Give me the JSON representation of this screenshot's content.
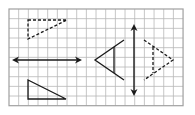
{
  "diagram": {
    "title": "",
    "grid": {
      "left": 9,
      "top": 9,
      "cols": 18,
      "rows": 10,
      "cell": 9.67,
      "line_color": "#b8b8b8",
      "border_color": "#a0a0a0"
    },
    "shapes": [
      {
        "id": "top-left-dashed-triangle",
        "type": "polygon",
        "style": "dashed",
        "points": [
          [
            28,
            20
          ],
          [
            67,
            20
          ],
          [
            28,
            39
          ]
        ]
      },
      {
        "id": "horizontal-double-arrow",
        "type": "double-arrow",
        "from": [
          12,
          60
        ],
        "to": [
          82,
          60
        ]
      },
      {
        "id": "bottom-left-solid-triangle",
        "type": "polygon",
        "style": "solid",
        "points": [
          [
            28,
            80
          ],
          [
            28,
            99
          ],
          [
            66,
            99
          ]
        ]
      },
      {
        "id": "left-solid-kite-triangle",
        "type": "open-polyline",
        "style": "solid",
        "points": [
          [
            124,
            40
          ],
          [
            95,
            60
          ],
          [
            124,
            80
          ]
        ]
      },
      {
        "id": "left-solid-inner-line",
        "type": "line",
        "style": "solid",
        "from": [
          114,
          47
        ],
        "to": [
          114,
          73
        ]
      },
      {
        "id": "vertical-double-arrow",
        "type": "double-arrow",
        "from": [
          134,
          24
        ],
        "to": [
          134,
          96
        ]
      },
      {
        "id": "right-dashed-kite-triangle",
        "type": "open-polyline",
        "style": "dashed",
        "points": [
          [
            144,
            40
          ],
          [
            173,
            60
          ],
          [
            144,
            80
          ]
        ]
      },
      {
        "id": "right-dashed-inner-line",
        "type": "line",
        "style": "dashed",
        "from": [
          153,
          47
        ],
        "to": [
          153,
          73
        ]
      }
    ],
    "stroke_color": "#1a1a1a"
  }
}
